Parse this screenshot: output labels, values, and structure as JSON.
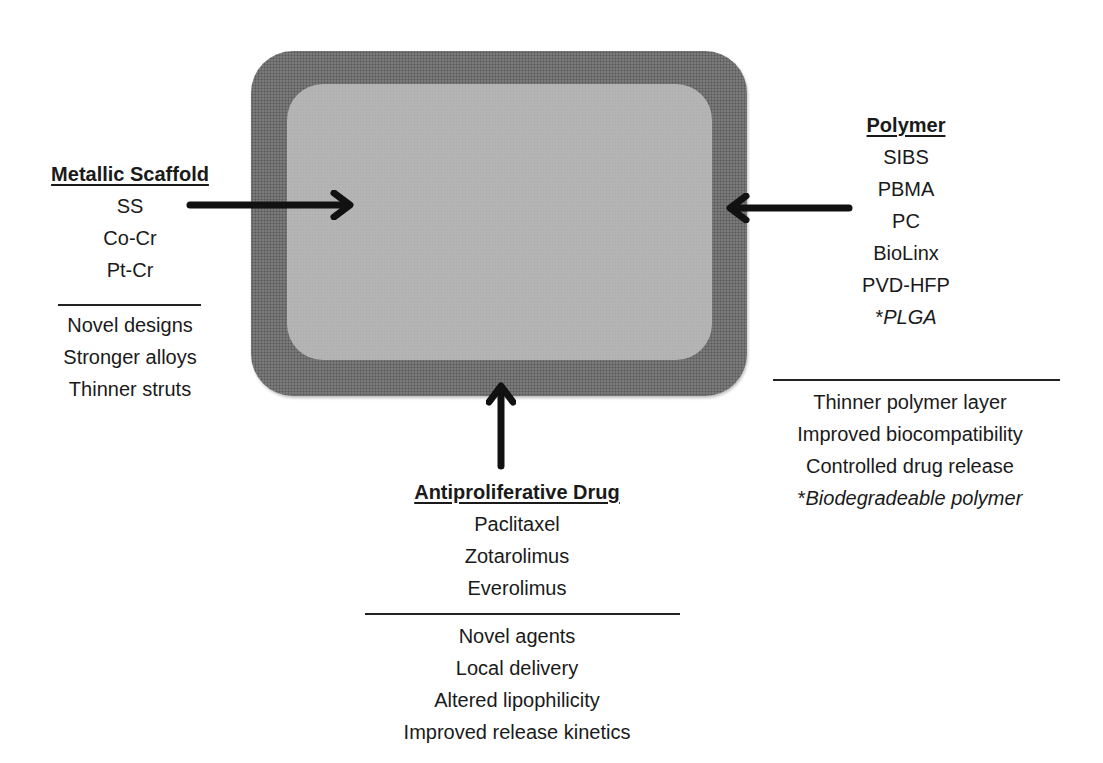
{
  "diagram": {
    "center_shape": "stent-strut",
    "colors": {
      "frame": "#7a7a7a",
      "fill": "#b4b4b4",
      "arrow": "#111111",
      "text": "#1a1a1a"
    }
  },
  "metallic_scaffold": {
    "title": "Metallic Scaffold",
    "items": [
      "SS",
      "Co-Cr",
      "Pt-Cr"
    ],
    "improvements": [
      "Novel designs",
      "Stronger alloys",
      "Thinner struts"
    ]
  },
  "polymer": {
    "title": "Polymer",
    "items": [
      "SIBS",
      "PBMA",
      "PC",
      "BioLinx",
      "PVD-HFP"
    ],
    "italic_item": {
      "prefix": "*",
      "text": "PLGA"
    },
    "improvements": [
      "Thinner polymer layer",
      "Improved biocompatibility",
      "Controlled drug release"
    ],
    "italic_improvement": {
      "prefix": "*",
      "text": "Biodegradeable polymer"
    }
  },
  "antiproliferative_drug": {
    "title": "Antiproliferative Drug",
    "items": [
      "Paclitaxel",
      "Zotarolimus",
      "Everolimus"
    ],
    "improvements": [
      "Novel agents",
      "Local delivery",
      "Altered lipophilicity",
      "Improved release kinetics"
    ]
  },
  "arrows": [
    {
      "name": "metallic-scaffold-arrow",
      "direction": "right"
    },
    {
      "name": "polymer-arrow",
      "direction": "left"
    },
    {
      "name": "drug-arrow",
      "direction": "up"
    }
  ]
}
